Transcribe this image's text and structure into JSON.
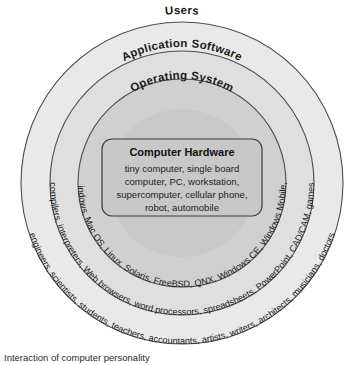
{
  "diagram": {
    "caption": "Interaction of computer personality",
    "layers": [
      {
        "name": "users",
        "title": "Users",
        "items_text": "engineers, scientists, students, teachers, accountants, artists, writers, architects, musicians, doctors",
        "fill": "#e8e8e8",
        "stroke": "#4a4a4a"
      },
      {
        "name": "application-software",
        "title": "Application Software",
        "items_text": "compilers, interpreters, Web browsers, word processors, spreadsheets, PowerPoint, CAD/CAM, games",
        "fill": "#dedede",
        "stroke": "#4a4a4a"
      },
      {
        "name": "operating-system",
        "title": "Operating System",
        "items_text": "MS-DOS, Windows, Mac OS, Linux, Solaris, FreeBSD, QNX, Windows CE, Windows Mobile, iPhone OS",
        "fill": "#cfcfcf",
        "stroke": "#4a4a4a"
      }
    ],
    "core": {
      "title": "Computer Hardware",
      "lines": [
        "tiny computer, single board",
        "computer, PC, workstation,",
        "supercomputer, cellular phone,",
        "robot, automobile"
      ],
      "fill": "#c6c6c6",
      "stroke": "#3c3c3c"
    }
  }
}
